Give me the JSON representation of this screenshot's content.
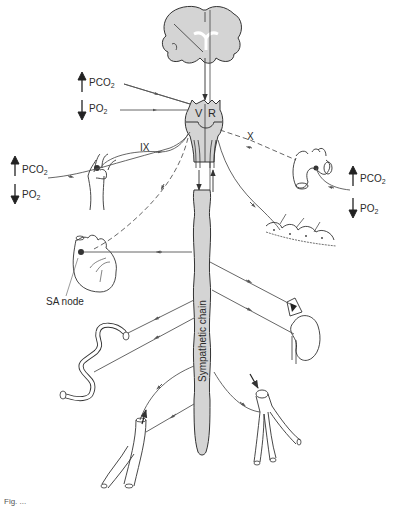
{
  "diagram": {
    "type": "physiology-schematic",
    "colors": {
      "tissue_fill": "#d4d4d4",
      "line": "#3a3a3a",
      "marker": "#222222",
      "background": "#ffffff"
    },
    "labels": {
      "medulla_left": "V",
      "medulla_right": "R",
      "nerve_ix": "IX",
      "nerve_x": "X",
      "sa_node": "SA node",
      "sympathetic_chain": "Sympathetic chain"
    },
    "gas_inputs": {
      "top_left": {
        "pco2_label": "PCO",
        "pco2_sub": "2",
        "pco2_dir": "up",
        "po2_label": "PO",
        "po2_sub": "2",
        "po2_dir": "down"
      },
      "carotid": {
        "pco2_label": "PCO",
        "pco2_sub": "2",
        "pco2_dir": "up",
        "po2_label": "PO",
        "po2_sub": "2",
        "po2_dir": "down"
      },
      "aortic": {
        "pco2_label": "PCO",
        "pco2_sub": "2",
        "pco2_dir": "up",
        "po2_label": "PO",
        "po2_sub": "2",
        "po2_dir": "down"
      }
    },
    "nodes": [
      {
        "id": "brain",
        "label": "Cerebrum"
      },
      {
        "id": "medulla",
        "label": "Medulla (V, R)"
      },
      {
        "id": "carotid-body",
        "label": "Carotid body"
      },
      {
        "id": "aortic-body",
        "label": "Aortic arch"
      },
      {
        "id": "heart",
        "label": "Heart"
      },
      {
        "id": "skin",
        "label": "Skin / sweat glands"
      },
      {
        "id": "adrenal-kidney",
        "label": "Adrenal gland and kidney"
      },
      {
        "id": "intestine",
        "label": "Intestine"
      },
      {
        "id": "vein",
        "label": "Vein"
      },
      {
        "id": "artery",
        "label": "Artery"
      },
      {
        "id": "spinal-cord",
        "label": "Sympathetic chain"
      }
    ],
    "caption": "Fig. ..."
  }
}
